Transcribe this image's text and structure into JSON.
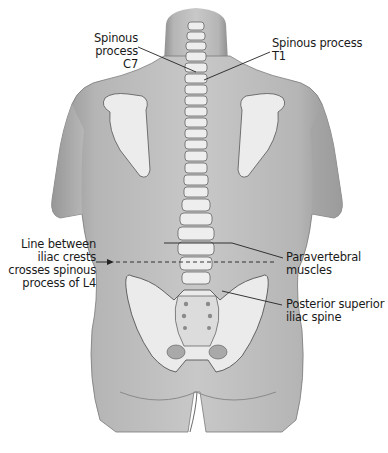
{
  "figure": {
    "colors": {
      "skin": "#b9b9b9",
      "skin_shadow": "#8e8e8e",
      "bone": "#ededed",
      "bone_outline": "#555555",
      "leader_line": "#222222",
      "background": "#ffffff"
    }
  },
  "labels": {
    "c7": {
      "line1": "Spinous process",
      "line2": "C7"
    },
    "t1": {
      "line1": "Spinous process",
      "line2": "T1"
    },
    "iliac_line": {
      "line1": "Line between",
      "line2": "iliac crests",
      "line3": "crosses spinous",
      "line4": "process of L4"
    },
    "paravertebral": {
      "line1": "Paravertebral",
      "line2": "muscles"
    },
    "psis": {
      "line1": "Posterior superior",
      "line2": "iliac spine"
    }
  }
}
